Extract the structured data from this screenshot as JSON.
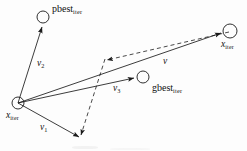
{
  "figure": {
    "background": "#fdfdfd",
    "stroke_color": "#1a1a1a",
    "width": 247,
    "height": 151
  },
  "labels": {
    "pbest": {
      "base": "pbest",
      "sub": "iter",
      "x": 52,
      "y": 5
    },
    "gbest": {
      "base": "gbest",
      "sub": "iter",
      "x": 152,
      "y": 84
    },
    "x_current": {
      "base": "x",
      "sub": "iter",
      "x": 6,
      "y": 112
    },
    "x_next": {
      "base": "x",
      "sub": "iter",
      "x": 222,
      "y": 41
    },
    "v1": {
      "base": "v",
      "sub": "1",
      "x": 40,
      "y": 124
    },
    "v2": {
      "base": "v",
      "sub": "2",
      "x": 37,
      "y": 60
    },
    "v3": {
      "base": "v",
      "sub": "3",
      "x": 113,
      "y": 85
    },
    "v": {
      "base": "v",
      "sub": "",
      "x": 163,
      "y": 58
    }
  },
  "nodes": [
    {
      "name": "pbest-node",
      "cx": 43,
      "cy": 17,
      "r": 6
    },
    {
      "name": "origin-node",
      "cx": 18,
      "cy": 103,
      "r": 6
    },
    {
      "name": "gbest-node",
      "cx": 143,
      "cy": 77,
      "r": 6
    },
    {
      "name": "next-position-node",
      "cx": 230,
      "cy": 31,
      "r": 7
    }
  ],
  "vectors": [
    {
      "name": "v2-to-pbest",
      "style": "solid",
      "x1": 18,
      "y1": 103,
      "x2": 42,
      "y2": 27
    },
    {
      "name": "v1-inertia",
      "style": "solid",
      "x1": 18,
      "y1": 103,
      "x2": 79,
      "y2": 137
    },
    {
      "name": "v3-to-gbest",
      "style": "solid",
      "x1": 18,
      "y1": 103,
      "x2": 134,
      "y2": 78
    },
    {
      "name": "v-resultant",
      "style": "solid",
      "x1": 18,
      "y1": 103,
      "x2": 221,
      "y2": 33
    },
    {
      "name": "dashed-social-component",
      "style": "dashed",
      "x1": 230,
      "y1": 31,
      "x2": 106,
      "y2": 60
    },
    {
      "name": "dashed-cognitive-component",
      "style": "dashed",
      "x1": 106,
      "y1": 60,
      "x2": 80,
      "y2": 136
    }
  ],
  "legend_note": ""
}
